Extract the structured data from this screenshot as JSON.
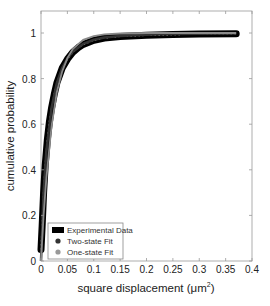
{
  "chart_data": {
    "type": "line",
    "title": "",
    "xlabel": "square displacement (μm²)",
    "xlabel_main": "square displacement (μm",
    "xlabel_sup": "2",
    "xlabel_end": ")",
    "ylabel": "cumulative probability",
    "xlim": [
      0,
      0.4
    ],
    "ylim": [
      0,
      1.1
    ],
    "xticks": [
      "0",
      "0.05",
      "0.1",
      "0.15",
      "0.2",
      "0.25",
      "0.3",
      "0.35",
      "0.4"
    ],
    "yticks": [
      "0",
      "0.2",
      "0.4",
      "0.6",
      "0.8",
      "1"
    ],
    "grid": false,
    "legend_position": "lower left",
    "series": [
      {
        "name": "Experimental Data",
        "color": "#000000",
        "x": [
          0.0,
          0.002,
          0.005,
          0.008,
          0.012,
          0.016,
          0.02,
          0.025,
          0.03,
          0.04,
          0.05,
          0.06,
          0.07,
          0.08,
          0.1,
          0.12,
          0.15,
          0.2,
          0.25,
          0.3,
          0.37
        ],
        "values": [
          0.05,
          0.15,
          0.3,
          0.42,
          0.53,
          0.61,
          0.67,
          0.73,
          0.78,
          0.845,
          0.885,
          0.915,
          0.935,
          0.95,
          0.968,
          0.978,
          0.985,
          0.99,
          0.993,
          0.995,
          0.997
        ]
      },
      {
        "name": "Two-state Fit",
        "color": "#333333",
        "x": [
          0.0,
          0.005,
          0.01,
          0.02,
          0.03,
          0.04,
          0.05,
          0.06,
          0.08,
          0.1,
          0.12,
          0.15,
          0.2,
          0.25,
          0.3,
          0.37
        ],
        "values": [
          0.0,
          0.3,
          0.48,
          0.67,
          0.78,
          0.845,
          0.888,
          0.918,
          0.952,
          0.97,
          0.98,
          0.987,
          0.992,
          0.995,
          0.997,
          0.998
        ]
      },
      {
        "name": "One-state Fit",
        "color": "#888888",
        "x": [
          0.0,
          0.005,
          0.01,
          0.02,
          0.03,
          0.04,
          0.05,
          0.06,
          0.08,
          0.1,
          0.12,
          0.15,
          0.2,
          0.25,
          0.3,
          0.37
        ],
        "values": [
          0.0,
          0.2,
          0.36,
          0.59,
          0.74,
          0.83,
          0.89,
          0.93,
          0.97,
          0.986,
          0.994,
          0.998,
          1.0,
          1.0,
          1.0,
          1.0
        ]
      }
    ]
  }
}
